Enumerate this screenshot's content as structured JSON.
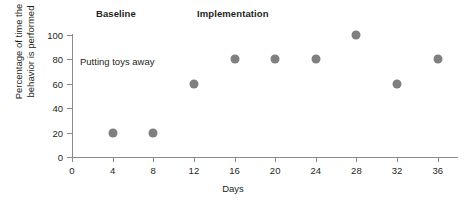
{
  "chart_data": {
    "type": "scatter",
    "title": "",
    "xlabel": "Days",
    "ylabel": "Percentage of time the\nbehavior is performed",
    "x": [
      4,
      8,
      12,
      16,
      20,
      24,
      28,
      32,
      36
    ],
    "values": [
      20,
      20,
      60,
      80,
      80,
      80,
      100,
      60,
      80
    ],
    "series": [
      {
        "name": "Putting toys away",
        "x": [
          4,
          8,
          12,
          16,
          20,
          24,
          28,
          32,
          36
        ],
        "values": [
          20,
          20,
          60,
          80,
          80,
          80,
          100,
          60,
          80
        ]
      }
    ],
    "xlim": [
      0,
      38
    ],
    "ylim": [
      0,
      100
    ],
    "xticks": [
      0,
      4,
      8,
      12,
      16,
      20,
      24,
      28,
      32,
      36
    ],
    "yticks": [
      0,
      20,
      40,
      60,
      80,
      100
    ],
    "xtick_labels": [
      "0",
      "4",
      "8",
      "12",
      "16",
      "20",
      "24",
      "28",
      "32",
      "36"
    ],
    "ytick_labels": [
      "0",
      "20",
      "40",
      "60",
      "80",
      "100"
    ],
    "grid": false,
    "legend": "none",
    "marker_color": "#7f7f7f",
    "axis_color": "#8a8a8a",
    "text_color": "#231f20",
    "annotations": [
      {
        "text": "Putting toys away",
        "x": 4,
        "y": 80
      }
    ],
    "phases": [
      {
        "label": "Baseline",
        "start": 0,
        "end": 10
      },
      {
        "label": "Implementation",
        "start": 10,
        "end": 38
      }
    ]
  },
  "chart": {
    "phase_baseline": "Baseline",
    "phase_implementation": "Implementation",
    "series_annotation": "Putting toys away",
    "x_axis_title": "Days",
    "y_axis_title": "Percentage of time the\nbehavior is performed"
  }
}
